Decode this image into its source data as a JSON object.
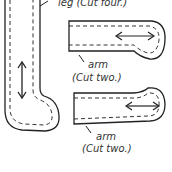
{
  "pieces": {
    "leg": {
      "label": "leg (Cut four.)"
    },
    "arm1": {
      "name": "arm",
      "count": "(Cut two.)"
    },
    "arm2": {
      "name": "arm",
      "count": "(Cut two.)"
    }
  },
  "colors": {
    "line": "#222222",
    "background": "#ffffff"
  }
}
